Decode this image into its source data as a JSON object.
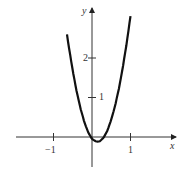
{
  "chart_data": {
    "type": "line",
    "title": "",
    "xlabel": "x",
    "ylabel": "y",
    "x_ticks": [
      -1,
      1
    ],
    "x_tick_labels": [
      "−1",
      "1"
    ],
    "y_ticks": [
      1,
      2
    ],
    "y_tick_labels": [
      "1",
      "2"
    ],
    "xlim": [
      -1.95,
      2.2
    ],
    "ylim": [
      -0.95,
      3.3
    ],
    "grid": false,
    "legend": null,
    "series": [
      {
        "name": "curve",
        "x": [
          -0.65,
          -0.6,
          -0.5,
          -0.4,
          -0.3,
          -0.2,
          -0.1,
          0.0,
          0.1,
          0.15,
          0.2,
          0.3,
          0.4,
          0.5,
          0.6,
          0.7,
          0.8,
          0.9,
          1.0
        ],
        "y": [
          2.6,
          2.27,
          1.68,
          1.16,
          0.73,
          0.38,
          0.12,
          -0.05,
          -0.11,
          -0.12,
          -0.11,
          -0.02,
          0.16,
          0.44,
          0.79,
          1.23,
          1.76,
          2.37,
          3.06
        ]
      }
    ]
  },
  "axes": {
    "x_label": "x",
    "y_label": "y",
    "x_tick_labels": [
      "−1",
      "1"
    ],
    "y_tick_labels": [
      "1",
      "2"
    ]
  }
}
